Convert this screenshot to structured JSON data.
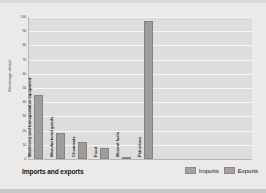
{
  "chart_data": {
    "type": "bar",
    "title": "Imports and exports",
    "xlabel": "",
    "ylabel": "Percentage of total",
    "ylim": [
      0,
      100
    ],
    "yticks": [
      100,
      90,
      80,
      70,
      60,
      50,
      40,
      30,
      20,
      10,
      0
    ],
    "grid": true,
    "legend_position": "bottom-right",
    "categories": [
      "Machinery and transportation equipment",
      "Manufactured goods",
      "Chemicals",
      "Food",
      "Mineral fuels",
      "Petroleum"
    ],
    "values": [
      45,
      18,
      12,
      8,
      1,
      97
    ],
    "series": [
      {
        "name": "Imports",
        "color": "#9e9d9c"
      },
      {
        "name": "Exports",
        "color": "#9e9d9c"
      }
    ],
    "legend": [
      "Imports",
      "Exports"
    ],
    "bar_color": "#9e9d9c",
    "plot_background": "#dedddb",
    "figure_background": "#eceae9"
  },
  "legend": {
    "imports_label": "Imports",
    "exports_label": "Exports"
  },
  "footer": {
    "title": "Imports and exports"
  },
  "axes": {
    "y_title": "Percentage of total"
  }
}
